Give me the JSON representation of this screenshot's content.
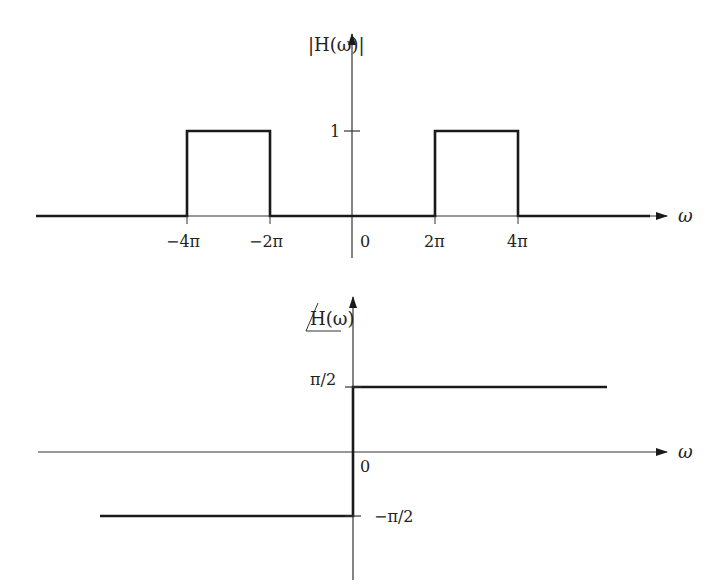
{
  "diagram": {
    "magnitude_plot": {
      "y_label": "|H(ω)|",
      "x_label": "ω",
      "y_ticks": [
        {
          "value": 1,
          "label": "1"
        }
      ],
      "x_ticks": [
        {
          "value": "-4π",
          "label": "−4π"
        },
        {
          "value": "-2π",
          "label": "−2π"
        },
        {
          "value": "0",
          "label": "0"
        },
        {
          "value": "2π",
          "label": "2π"
        },
        {
          "value": "4π",
          "label": "4π"
        }
      ],
      "segments": [
        {
          "from": "-∞",
          "to": "-4π",
          "value": 0
        },
        {
          "from": "-4π",
          "to": "-2π",
          "value": 1
        },
        {
          "from": "-2π",
          "to": "2π",
          "value": 0
        },
        {
          "from": "2π",
          "to": "4π",
          "value": 1
        },
        {
          "from": "4π",
          "to": "∞",
          "value": 0
        }
      ]
    },
    "phase_plot": {
      "y_label": "∠H(ω)",
      "y_label_text": "H(ω)",
      "x_label": "ω",
      "origin_label": "0",
      "y_ticks": [
        {
          "value": "π/2",
          "label": "π/2"
        },
        {
          "value": "-π/2",
          "label": "−π/2"
        }
      ],
      "segments": [
        {
          "from": "-∞",
          "to": "0",
          "value": "-π/2"
        },
        {
          "from": "0",
          "to": "∞",
          "value": "π/2"
        }
      ]
    },
    "colors": {
      "line": "#1a1a1a",
      "axis": "#333333",
      "background": "#ffffff"
    }
  }
}
